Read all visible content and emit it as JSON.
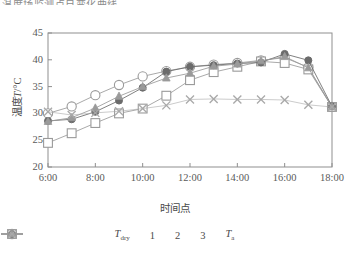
{
  "figure": {
    "clipped_caption_above": "温度场监测点日变化曲线。",
    "background_color": "#ffffff"
  },
  "chart_data": {
    "type": "line",
    "title": "",
    "xlabel": "时间点",
    "ylabel": "温度T/°C",
    "ylabel_plain": "温度 T / °C",
    "xtick_labels": [
      "6:00",
      "8:00",
      "10:00",
      "12:00",
      "14:00",
      "16:00",
      "18:00"
    ],
    "ytick_labels": [
      "20",
      "25",
      "30",
      "35",
      "40",
      "45"
    ],
    "ylim": [
      20,
      45
    ],
    "xlim": [
      6,
      18
    ],
    "grid": false,
    "legend_position": "below",
    "x": [
      6,
      7,
      8,
      9,
      10,
      11,
      12,
      13,
      14,
      15,
      16,
      17,
      18
    ],
    "series": [
      {
        "name": "T_dry",
        "label_main": "T",
        "label_sub": "dry",
        "marker": "open-circle",
        "color": "#9a9a9a",
        "values": [
          30.0,
          31.3,
          33.4,
          35.3,
          36.9,
          37.9,
          38.7,
          39.1,
          39.4,
          39.9,
          40.4,
          38.6,
          31.2
        ]
      },
      {
        "name": "1",
        "label_main": "1",
        "label_sub": "",
        "marker": "open-square",
        "color": "#9a9a9a",
        "values": [
          24.5,
          26.3,
          28.2,
          30.0,
          30.9,
          33.3,
          36.2,
          37.7,
          38.7,
          39.7,
          39.4,
          38.2,
          31.2
        ]
      },
      {
        "name": "2",
        "label_main": "2",
        "label_sub": "",
        "marker": "filled-circle",
        "color": "#6b6b6b",
        "values": [
          28.6,
          28.9,
          30.3,
          32.4,
          34.8,
          37.8,
          38.7,
          39.0,
          39.3,
          39.5,
          41.1,
          39.9,
          31.3
        ]
      },
      {
        "name": "3",
        "label_main": "3",
        "label_sub": "",
        "marker": "filled-triangle",
        "color": "#9a9a9a",
        "values": [
          28.5,
          29.2,
          31.0,
          33.2,
          35.0,
          36.6,
          37.5,
          38.8,
          39.2,
          39.8,
          40.6,
          38.5,
          31.2
        ]
      },
      {
        "name": "T_a",
        "label_main": "T",
        "label_sub": "a",
        "marker": "cross",
        "color": "#a8a8a8",
        "values": [
          30.3,
          29.7,
          30.1,
          30.4,
          30.9,
          31.5,
          32.6,
          32.7,
          32.6,
          32.6,
          32.5,
          31.6,
          31.2
        ]
      }
    ]
  }
}
